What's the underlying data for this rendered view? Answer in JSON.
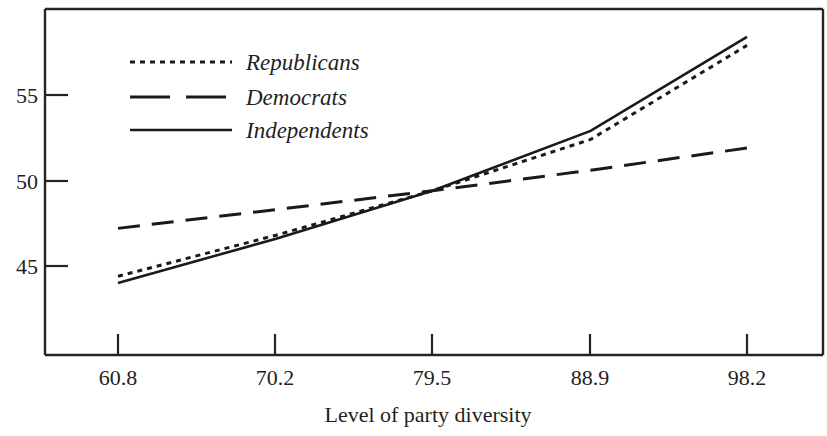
{
  "chart_data": {
    "type": "line",
    "title": "",
    "xlabel": "Level of party diversity",
    "ylabel": "",
    "x": [
      60.8,
      70.2,
      79.5,
      88.9,
      98.2
    ],
    "xlim": [
      58.0,
      100.0
    ],
    "ylim": [
      41.0,
      59.6
    ],
    "xticks": [
      "60.8",
      "70.2",
      "79.5",
      "88.9",
      "98.2"
    ],
    "yticks": [
      "45",
      "50",
      "55"
    ],
    "grid": false,
    "legend_position": "upper-left-inside",
    "series": [
      {
        "name": "Republicans",
        "style": "dotted",
        "values": [
          44.4,
          46.8,
          49.4,
          52.4,
          57.9
        ]
      },
      {
        "name": "Democrats",
        "style": "dashed",
        "values": [
          47.2,
          48.3,
          49.4,
          50.6,
          51.9
        ]
      },
      {
        "name": "Independents",
        "style": "solid",
        "values": [
          44.0,
          46.6,
          49.4,
          52.9,
          58.4
        ]
      }
    ]
  },
  "axes": {
    "x_tick_labels": [
      "60.8",
      "70.2",
      "79.5",
      "88.9",
      "98.2"
    ],
    "y_tick_labels": [
      "55",
      "50",
      "45"
    ],
    "x_axis_title": "Level of party diversity"
  },
  "legend": {
    "entries": [
      {
        "label": "Republicans",
        "style": "dotted"
      },
      {
        "label": "Democrats",
        "style": "dashed"
      },
      {
        "label": "Independents",
        "style": "solid"
      }
    ]
  },
  "colors": {
    "ink": "#1a1a1a",
    "frame": "#242424",
    "background": "#ffffff"
  }
}
